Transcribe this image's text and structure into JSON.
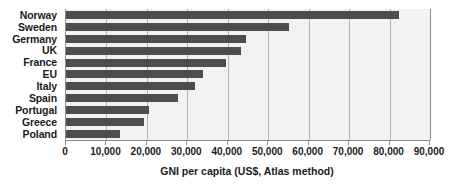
{
  "chart_data": {
    "type": "bar",
    "orientation": "horizontal",
    "title": "",
    "xlabel": "GNI per capita (US$, Atlas method)",
    "ylabel": "",
    "categories": [
      "Norway",
      "Sweden",
      "Germany",
      "UK",
      "France",
      "EU",
      "Italy",
      "Spain",
      "Portugal",
      "Greece",
      "Poland"
    ],
    "values": [
      82400,
      55200,
      44500,
      43300,
      39600,
      33900,
      31900,
      27700,
      20500,
      19300,
      13400
    ],
    "xlim": [
      0,
      90000
    ],
    "xticks": [
      0,
      10000,
      20000,
      30000,
      40000,
      50000,
      60000,
      70000,
      80000,
      90000
    ],
    "xtick_labels": [
      "0",
      "10,000",
      "20,000",
      "30,000",
      "40,000",
      "50,000",
      "60,000",
      "70,000",
      "80,000",
      "90,000"
    ],
    "grid": true,
    "grid_axis": "x",
    "legend": false,
    "bar_color": "#4d4d4d",
    "plot_background": "#f2f2f2",
    "gridline_color": "#b3b3b3",
    "axis_color": "#8c8c8c",
    "text_color": "#1a1a1a"
  }
}
